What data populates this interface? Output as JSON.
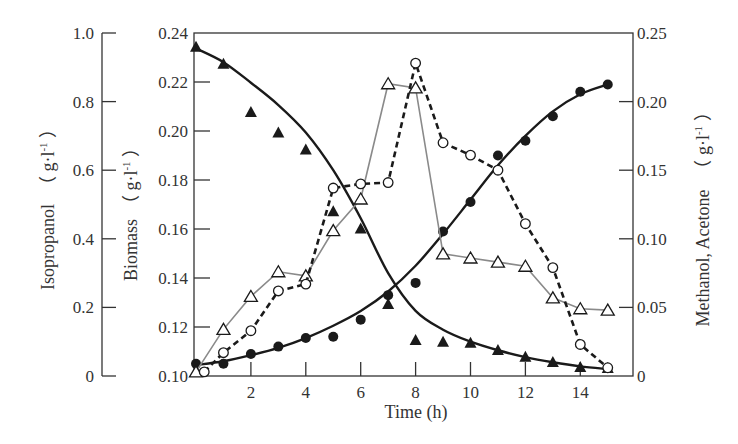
{
  "chart_data": {
    "type": "line",
    "title": "",
    "xlabel": "Time (h)",
    "xlim": [
      0,
      15.8
    ],
    "xticks": [
      2,
      4,
      6,
      8,
      10,
      12,
      14
    ],
    "grid": false,
    "legend": "none",
    "axes": {
      "isopropanol": {
        "label": "Isopropanol （g·l⁻¹）",
        "label_main": "Isopropanol",
        "label_unit": "（ g·l",
        "label_sup": "-1",
        "label_close": " ）",
        "range": [
          0,
          1.0
        ],
        "ticks": [
          "0",
          "0.2",
          "0.4",
          "0.6",
          "0.8",
          "1.0"
        ],
        "position": "far-left"
      },
      "biomass": {
        "label": "Biomass （g·l⁻¹）",
        "label_main": "Biomass",
        "label_unit": "（ g·l",
        "label_sup": "-1",
        "label_close": " ）",
        "range": [
          0.1,
          0.24
        ],
        "ticks": [
          "0.10",
          "0.12",
          "0.14",
          "0.16",
          "0.18",
          "0.20",
          "0.22",
          "0.24"
        ],
        "position": "left"
      },
      "methanol_acetone": {
        "label": "Methanol, Acetone （g·l⁻¹）",
        "label_main": "Methanol, Acetone",
        "label_unit": "（ g·l",
        "label_sup": "-1",
        "label_close": " ）",
        "range": [
          0,
          0.25
        ],
        "ticks": [
          "0",
          "0.05",
          "0.10",
          "0.15",
          "0.20",
          "0.25"
        ],
        "position": "right"
      }
    },
    "series": [
      {
        "name": "Isopropanol",
        "axis": "isopropanol",
        "marker": "filled-triangle",
        "line": "smooth-solid",
        "x": [
          0,
          1,
          2,
          3,
          4,
          5,
          6,
          7,
          8,
          9,
          10,
          11,
          12,
          13,
          14,
          15
        ],
        "values": [
          0.96,
          0.91,
          0.77,
          0.71,
          0.66,
          0.48,
          0.43,
          0.21,
          0.105,
          0.1,
          0.097,
          0.076,
          0.056,
          0.041,
          0.026,
          0.023
        ],
        "fit": [
          0.955,
          0.915,
          0.855,
          0.79,
          0.71,
          0.6,
          0.46,
          0.3,
          0.19,
          0.135,
          0.1,
          0.075,
          0.055,
          0.04,
          0.028,
          0.02
        ]
      },
      {
        "name": "Biomass",
        "axis": "biomass",
        "marker": "filled-circle",
        "line": "smooth-solid",
        "x": [
          0,
          1,
          2,
          3,
          4,
          5,
          6,
          7,
          8,
          9,
          10,
          11,
          12,
          13,
          14,
          15
        ],
        "values": [
          0.105,
          0.105,
          0.109,
          0.112,
          0.1155,
          0.116,
          0.123,
          0.133,
          0.138,
          0.159,
          0.171,
          0.19,
          0.196,
          0.206,
          0.216,
          0.219
        ],
        "fit": [
          0.1045,
          0.106,
          0.1085,
          0.1115,
          0.1155,
          0.1205,
          0.1265,
          0.1345,
          0.145,
          0.158,
          0.172,
          0.186,
          0.198,
          0.208,
          0.215,
          0.219
        ]
      },
      {
        "name": "Methanol",
        "axis": "methanol_acetone",
        "marker": "open-triangle",
        "line": "thin-gray",
        "x": [
          0,
          1,
          2,
          3,
          4,
          5,
          6,
          7,
          8,
          9,
          10,
          11,
          12,
          13,
          14,
          15
        ],
        "values": [
          0.003,
          0.034,
          0.058,
          0.076,
          0.073,
          0.106,
          0.129,
          0.213,
          0.21,
          0.089,
          0.086,
          0.083,
          0.08,
          0.057,
          0.049,
          0.048
        ]
      },
      {
        "name": "Acetone",
        "axis": "methanol_acetone",
        "marker": "open-circle",
        "line": "dashed",
        "x": [
          0.3,
          1,
          2,
          3,
          4,
          5,
          6,
          7,
          8,
          9,
          10,
          11,
          12,
          13,
          14,
          15
        ],
        "values": [
          0.003,
          0.017,
          0.033,
          0.062,
          0.067,
          0.137,
          0.14,
          0.141,
          0.228,
          0.17,
          0.161,
          0.15,
          0.111,
          0.079,
          0.023,
          0.006
        ]
      }
    ],
    "colors": {
      "axis": "#333333",
      "text": "#333333",
      "solid_line": "#1a1a1a",
      "methanol_line": "#8a8a8a",
      "marker_fill": "#1a1a1a",
      "open_marker_fill": "#ffffff"
    }
  }
}
